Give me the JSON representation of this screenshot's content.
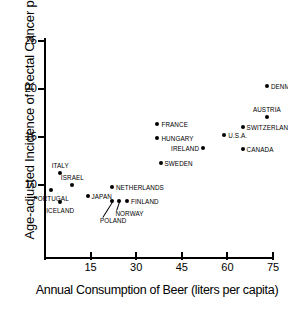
{
  "chart_data": {
    "type": "scatter",
    "title": "",
    "xlabel": "Annual Consumption of Beer (liters per capita)",
    "ylabel": "Age-adjusted Incidence of Rectal Cancer per 100,000",
    "xlim": [
      0,
      130
    ],
    "ylim": [
      7.5,
      25.5
    ],
    "xticks": [
      15,
      30,
      45,
      60,
      75,
      90,
      105,
      120
    ],
    "yticks": [
      10,
      15,
      20,
      25
    ],
    "grid": false,
    "legend": "none",
    "points": [
      {
        "label": "CZECHOSLOVAKIA",
        "x": 104,
        "y": 22.8,
        "pos": "top"
      },
      {
        "label": "DENMARK",
        "x": 73,
        "y": 20.3,
        "pos": "right"
      },
      {
        "label": "N.ZEALAND",
        "x": 105,
        "y": 20.1,
        "pos": "right"
      },
      {
        "label": "BELGIUM",
        "x": 112,
        "y": 19.0,
        "pos": "right"
      },
      {
        "label": "AUSTRIA",
        "x": 73,
        "y": 17.1,
        "pos": "top"
      },
      {
        "label": "U.K.",
        "x": 86,
        "y": 16.8,
        "pos": "top-right"
      },
      {
        "label": "W. GERMANY",
        "x": 97,
        "y": 16.3,
        "pos": "right"
      },
      {
        "label": "FRANCE",
        "x": 37,
        "y": 16.4,
        "pos": "right"
      },
      {
        "label": "SWITZERLAND",
        "x": 65,
        "y": 16.0,
        "pos": "right"
      },
      {
        "label": "U.S.A.",
        "x": 59,
        "y": 15.2,
        "pos": "right"
      },
      {
        "label": "HUNGARY",
        "x": 37,
        "y": 14.9,
        "pos": "right"
      },
      {
        "label": "IRELAND",
        "x": 52,
        "y": 13.9,
        "pos": "left"
      },
      {
        "label": "CANADA",
        "x": 65,
        "y": 13.8,
        "pos": "right"
      },
      {
        "label": "AUSTRALIA",
        "x": 104,
        "y": 13.8,
        "pos": "right"
      },
      {
        "label": "SWEDEN",
        "x": 38,
        "y": 12.3,
        "pos": "right"
      },
      {
        "label": "ITALY",
        "x": 5,
        "y": 11.3,
        "pos": "top"
      },
      {
        "label": "ISRAEL",
        "x": 9,
        "y": 10.0,
        "pos": "top"
      },
      {
        "label": "PORTUGAL",
        "x": 2,
        "y": 9.5,
        "pos": "bottom"
      },
      {
        "label": "NETHERLANDS",
        "x": 22,
        "y": 9.8,
        "pos": "right"
      },
      {
        "label": "JAPAN",
        "x": 14,
        "y": 8.9,
        "pos": "right"
      },
      {
        "label": "ICELAND",
        "x": 5,
        "y": 8.2,
        "pos": "bottom"
      },
      {
        "label": "POLAND",
        "x": 22,
        "y": 8.35,
        "pos": "leader-down"
      },
      {
        "label": "NORWAY",
        "x": 24.5,
        "y": 8.35,
        "pos": "leader-down"
      },
      {
        "label": "FINLAND",
        "x": 27,
        "y": 8.35,
        "pos": "right"
      }
    ]
  }
}
